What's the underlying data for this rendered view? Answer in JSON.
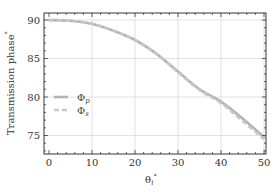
{
  "chart_data": {
    "type": "line",
    "title": "",
    "xlabel": "θ_i°",
    "ylabel": "Transmission phase°",
    "xlim": [
      0,
      50
    ],
    "ylim": [
      72.5,
      91.3
    ],
    "xticks": [
      0,
      10,
      20,
      30,
      40,
      50
    ],
    "yticks": [
      75,
      80,
      85,
      90
    ],
    "grid": true,
    "legend_position": "center-left",
    "x": [
      0,
      5,
      10,
      15,
      20,
      25,
      30,
      35,
      40,
      45,
      50
    ],
    "series": [
      {
        "name": "Φp",
        "style": "solid",
        "color": "#b3b3b3",
        "values": [
          90.0,
          89.9,
          89.5,
          88.6,
          87.4,
          85.6,
          83.3,
          81.0,
          79.4,
          77.2,
          74.8
        ]
      },
      {
        "name": "Φs",
        "style": "dashed",
        "color": "#c8c8c8",
        "values": [
          90.0,
          89.9,
          89.5,
          88.6,
          87.4,
          85.6,
          83.2,
          80.9,
          79.2,
          76.9,
          74.5
        ]
      }
    ]
  },
  "legend": {
    "items": [
      {
        "symbol": "Φ",
        "sub": "p"
      },
      {
        "symbol": "Φ",
        "sub": "s"
      }
    ]
  },
  "axes": {
    "xlabel_main": "θ",
    "xlabel_sub": "i",
    "xlabel_sup": "°",
    "ylabel_main": "Transmission phase",
    "ylabel_sup": "°"
  }
}
